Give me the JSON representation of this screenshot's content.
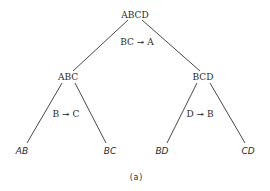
{
  "diagram": {
    "type": "decomposition-tree",
    "root": {
      "label": "ABCD"
    },
    "nodes": {
      "root": "ABCD",
      "left": "ABC",
      "right": "BCD",
      "leaf_1": "AB",
      "leaf_2": "BC",
      "leaf_3": "BD",
      "leaf_4": "CD"
    },
    "edge_labels": {
      "root_split": "BC ↠ A",
      "left_split": "B ↠ C",
      "right_split": "D ↠ B"
    },
    "caption": "(a)",
    "colors": {
      "line": "#333333",
      "text": "#2a2a2a",
      "background": "#ffffff"
    }
  }
}
